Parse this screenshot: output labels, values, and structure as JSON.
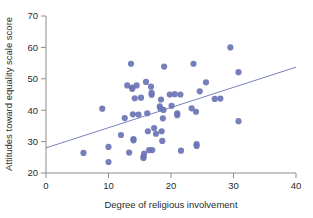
{
  "chart_data": {
    "type": "scatter",
    "title": "",
    "xlabel": "Degree of religious involvement",
    "ylabel": "Attitudes toward equality scale score",
    "xlim": [
      0,
      40
    ],
    "ylim": [
      20,
      70
    ],
    "xticks": [
      0,
      10,
      20,
      30,
      40
    ],
    "yticks": [
      20,
      30,
      40,
      50,
      60,
      70
    ],
    "xtick_labels": [
      "0",
      "10",
      "20",
      "30",
      "40"
    ],
    "ytick_labels": [
      "20",
      "30",
      "40",
      "50",
      "60",
      "70"
    ],
    "grid": false,
    "legend": null,
    "marker_color": "#6b74b4",
    "marker_size": 4.4,
    "line_color": "#6b74b4",
    "trendline": {
      "type": "linear-fit",
      "x_start": 0,
      "y_start": 28.0,
      "x_end": 40,
      "y_end": 53.7
    },
    "points": [
      [
        6.0,
        26.4
      ],
      [
        9.0,
        40.5
      ],
      [
        10.0,
        28.3
      ],
      [
        10.0,
        23.5
      ],
      [
        12.0,
        32.1
      ],
      [
        12.6,
        37.5
      ],
      [
        13.0,
        47.9
      ],
      [
        13.3,
        26.5
      ],
      [
        13.6,
        54.8
      ],
      [
        13.8,
        47.2
      ],
      [
        13.8,
        46.8
      ],
      [
        13.9,
        38.7
      ],
      [
        14.0,
        30.8
      ],
      [
        14.0,
        30.4
      ],
      [
        14.2,
        43.8
      ],
      [
        14.5,
        47.9
      ],
      [
        14.8,
        38.6
      ],
      [
        15.2,
        44.0
      ],
      [
        15.6,
        25.2
      ],
      [
        15.6,
        24.8
      ],
      [
        15.7,
        26.2
      ],
      [
        16.0,
        49.0
      ],
      [
        16.2,
        39.0
      ],
      [
        16.3,
        33.3
      ],
      [
        16.5,
        27.3
      ],
      [
        16.8,
        47.5
      ],
      [
        16.9,
        45.5
      ],
      [
        16.9,
        44.9
      ],
      [
        17.0,
        27.3
      ],
      [
        17.3,
        34.3
      ],
      [
        17.6,
        32.5
      ],
      [
        18.2,
        41.2
      ],
      [
        18.3,
        40.6
      ],
      [
        18.4,
        43.4
      ],
      [
        18.5,
        33.3
      ],
      [
        18.6,
        30.2
      ],
      [
        18.7,
        37.4
      ],
      [
        18.8,
        40.1
      ],
      [
        18.9,
        53.9
      ],
      [
        19.8,
        45.0
      ],
      [
        20.1,
        41.4
      ],
      [
        20.6,
        45.1
      ],
      [
        21.0,
        38.4
      ],
      [
        21.0,
        39.0
      ],
      [
        21.5,
        45.0
      ],
      [
        21.6,
        27.1
      ],
      [
        23.3,
        40.6
      ],
      [
        23.6,
        54.8
      ],
      [
        24.0,
        39.5
      ],
      [
        24.1,
        29.2
      ],
      [
        24.1,
        28.6
      ],
      [
        24.6,
        46.0
      ],
      [
        25.6,
        48.9
      ],
      [
        27.0,
        43.6
      ],
      [
        27.9,
        43.7
      ],
      [
        29.5,
        60.0
      ],
      [
        30.8,
        52.1
      ],
      [
        30.8,
        36.5
      ]
    ]
  }
}
